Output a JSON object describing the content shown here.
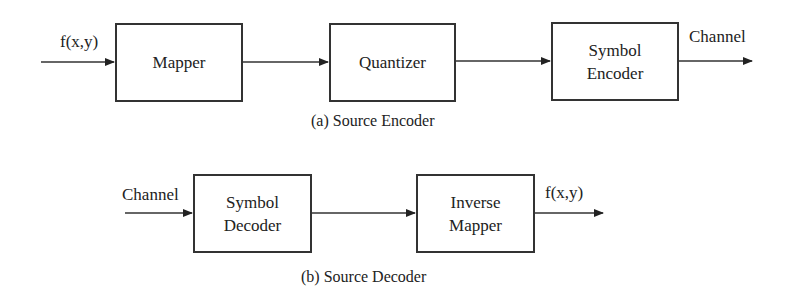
{
  "encoder": {
    "input_label": "f(x,y)",
    "blocks": [
      "Mapper",
      "Quantizer",
      "Symbol\nEncoder"
    ],
    "block_lines": [
      [
        "Mapper"
      ],
      [
        "Quantizer"
      ],
      [
        "Symbol",
        "Encoder"
      ]
    ],
    "output_label": "Channel",
    "caption": "(a) Source Encoder"
  },
  "decoder": {
    "input_label": "Channel",
    "block_lines": [
      [
        "Symbol",
        "Decoder"
      ],
      [
        "Inverse",
        "Mapper"
      ]
    ],
    "output_label": "f(x,y)",
    "caption": "(b) Source Decoder"
  }
}
